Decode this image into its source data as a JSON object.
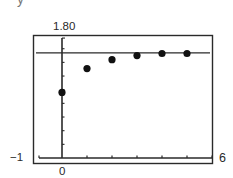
{
  "page": {
    "corner_fragment": "y"
  },
  "chart_data": {
    "type": "scatter",
    "title": "",
    "xlabel": "",
    "ylabel": "",
    "xlim": [
      -1,
      6
    ],
    "ylim": [
      0,
      1.8
    ],
    "window_labels": {
      "ymax": "1.80",
      "xmin": "−1",
      "xmax": "6",
      "origin": "0"
    },
    "x_ticks": [
      1,
      2,
      3,
      4,
      5,
      6
    ],
    "y_tick_step": 0.2,
    "grid": false,
    "legend": null,
    "series": [
      {
        "name": "sequence terms",
        "x": [
          0,
          1,
          2,
          3,
          4,
          5
        ],
        "y": [
          0.96,
          1.31,
          1.44,
          1.5,
          1.53,
          1.53
        ]
      }
    ],
    "horizontal_line": {
      "y": 1.54,
      "label": "asymptote"
    }
  }
}
